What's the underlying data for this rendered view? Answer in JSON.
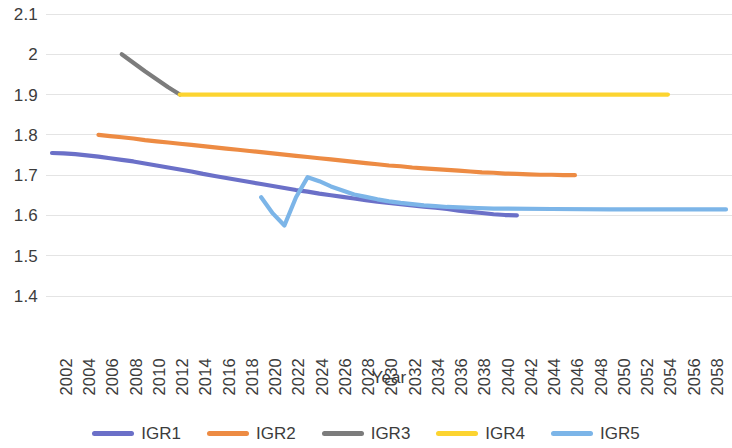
{
  "chart_data": {
    "type": "line",
    "title": "",
    "xlabel": "Year",
    "ylabel": "",
    "xlim": [
      2002,
      2060
    ],
    "ylim": [
      1.4,
      2.1
    ],
    "grid": true,
    "legend_position": "bottom",
    "y_ticks": [
      "2.1",
      "2",
      "1.9",
      "1.8",
      "1.7",
      "1.6",
      "1.5",
      "1.4"
    ],
    "y_tick_values": [
      2.1,
      2.0,
      1.9,
      1.8,
      1.7,
      1.6,
      1.5,
      1.4
    ],
    "x_ticks": [
      "2002",
      "2004",
      "2006",
      "2008",
      "2010",
      "2012",
      "2014",
      "2016",
      "2018",
      "2020",
      "2022",
      "2024",
      "2026",
      "2028",
      "2030",
      "2032",
      "2034",
      "2036",
      "2038",
      "2040",
      "2042",
      "2044",
      "2046",
      "2048",
      "2050",
      "2052",
      "2054",
      "2056",
      "2058",
      "2060"
    ],
    "x_tick_values": [
      2002,
      2004,
      2006,
      2008,
      2010,
      2012,
      2014,
      2016,
      2018,
      2020,
      2022,
      2024,
      2026,
      2028,
      2030,
      2032,
      2034,
      2036,
      2038,
      2040,
      2042,
      2044,
      2046,
      2048,
      2050,
      2052,
      2054,
      2056,
      2058,
      2060
    ],
    "series": [
      {
        "name": "IGR1",
        "color": "#6B70C8",
        "x": [
          2002,
          2003,
          2004,
          2005,
          2006,
          2007,
          2008,
          2009,
          2010,
          2011,
          2012,
          2013,
          2014,
          2015,
          2016,
          2017,
          2018,
          2019,
          2020,
          2021,
          2022,
          2023,
          2024,
          2025,
          2026,
          2027,
          2028,
          2029,
          2030,
          2031,
          2032,
          2033,
          2034,
          2035,
          2036,
          2037,
          2038,
          2039,
          2040,
          2041,
          2042
        ],
        "values": [
          1.755,
          1.754,
          1.752,
          1.749,
          1.746,
          1.742,
          1.738,
          1.734,
          1.729,
          1.724,
          1.719,
          1.714,
          1.709,
          1.703,
          1.698,
          1.693,
          1.688,
          1.683,
          1.678,
          1.673,
          1.668,
          1.663,
          1.659,
          1.654,
          1.65,
          1.646,
          1.642,
          1.638,
          1.634,
          1.631,
          1.628,
          1.625,
          1.622,
          1.619,
          1.616,
          1.612,
          1.609,
          1.606,
          1.603,
          1.601,
          1.6
        ]
      },
      {
        "name": "IGR2",
        "color": "#ED8B43",
        "x": [
          2006,
          2007,
          2008,
          2009,
          2010,
          2011,
          2012,
          2013,
          2014,
          2015,
          2016,
          2017,
          2018,
          2019,
          2020,
          2021,
          2022,
          2023,
          2024,
          2025,
          2026,
          2027,
          2028,
          2029,
          2030,
          2031,
          2032,
          2033,
          2034,
          2035,
          2036,
          2037,
          2038,
          2039,
          2040,
          2041,
          2042,
          2043,
          2044,
          2045,
          2046,
          2047
        ],
        "values": [
          1.8,
          1.797,
          1.794,
          1.791,
          1.787,
          1.784,
          1.781,
          1.778,
          1.775,
          1.772,
          1.769,
          1.766,
          1.763,
          1.76,
          1.757,
          1.754,
          1.751,
          1.748,
          1.745,
          1.742,
          1.739,
          1.736,
          1.733,
          1.73,
          1.727,
          1.724,
          1.722,
          1.719,
          1.717,
          1.715,
          1.713,
          1.711,
          1.709,
          1.707,
          1.706,
          1.704,
          1.703,
          1.702,
          1.701,
          1.701,
          1.7,
          1.7
        ]
      },
      {
        "name": "IGR3",
        "color": "#7C7C7C",
        "x": [
          2008,
          2009,
          2010,
          2011,
          2012,
          2013
        ],
        "values": [
          2.0,
          1.979,
          1.958,
          1.938,
          1.918,
          1.9
        ]
      },
      {
        "name": "IGR4",
        "color": "#FCD430",
        "x": [
          2013,
          2020,
          2030,
          2040,
          2050,
          2055
        ],
        "values": [
          1.9,
          1.9,
          1.9,
          1.9,
          1.9,
          1.9
        ]
      },
      {
        "name": "IGR5",
        "color": "#7CB5E8",
        "x": [
          2020,
          2021,
          2022,
          2023,
          2024,
          2025,
          2026,
          2027,
          2028,
          2029,
          2030,
          2031,
          2032,
          2033,
          2034,
          2035,
          2036,
          2037,
          2038,
          2040,
          2045,
          2050,
          2055,
          2060
        ],
        "values": [
          1.645,
          1.605,
          1.575,
          1.645,
          1.695,
          1.685,
          1.672,
          1.662,
          1.652,
          1.646,
          1.64,
          1.635,
          1.631,
          1.628,
          1.625,
          1.623,
          1.621,
          1.62,
          1.619,
          1.617,
          1.616,
          1.615,
          1.615,
          1.615
        ]
      }
    ]
  },
  "legend": {
    "items": [
      {
        "label": "IGR1",
        "color": "#6B70C8"
      },
      {
        "label": "IGR2",
        "color": "#ED8B43"
      },
      {
        "label": "IGR3",
        "color": "#7C7C7C"
      },
      {
        "label": "IGR4",
        "color": "#FCD430"
      },
      {
        "label": "IGR5",
        "color": "#7CB5E8"
      }
    ]
  },
  "axis_titles": {
    "x": "Year"
  }
}
